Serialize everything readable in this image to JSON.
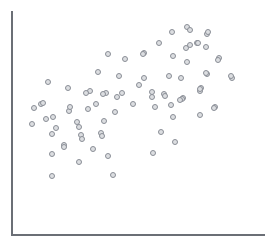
{
  "chart_data": {
    "type": "scatter",
    "title": "",
    "subtitle": "",
    "xlabel": "",
    "ylabel": "",
    "xticklabels": [],
    "yticklabels": [],
    "grid": false,
    "legend": null,
    "legend_position": "none",
    "axes": {
      "spines_visible": [
        "left",
        "bottom"
      ],
      "spine_color": "#6b6f76",
      "xlim": [
        0,
        278
      ],
      "ylim": [
        0,
        244
      ],
      "note": "Axes are unlabeled; values below are given in pixel coordinates of the figure, origin top-left."
    },
    "marker": {
      "shape": "circle-open",
      "size_px": 6,
      "edge_color": "#8a8e96",
      "face_color": "#dcdee1",
      "edge_width_px": 1
    },
    "n_points": 84,
    "background_color": "#ffffff",
    "points": [
      {
        "x": 172,
        "y": 32
      },
      {
        "x": 187,
        "y": 27
      },
      {
        "x": 207,
        "y": 34
      },
      {
        "x": 159,
        "y": 43
      },
      {
        "x": 186,
        "y": 48
      },
      {
        "x": 197,
        "y": 43
      },
      {
        "x": 206,
        "y": 47
      },
      {
        "x": 144,
        "y": 53
      },
      {
        "x": 190,
        "y": 30
      },
      {
        "x": 208,
        "y": 32
      },
      {
        "x": 198,
        "y": 43
      },
      {
        "x": 219,
        "y": 58
      },
      {
        "x": 108,
        "y": 54
      },
      {
        "x": 125,
        "y": 59
      },
      {
        "x": 143,
        "y": 54
      },
      {
        "x": 173,
        "y": 56
      },
      {
        "x": 187,
        "y": 62
      },
      {
        "x": 218,
        "y": 60
      },
      {
        "x": 98,
        "y": 72
      },
      {
        "x": 119,
        "y": 76
      },
      {
        "x": 144,
        "y": 78
      },
      {
        "x": 169,
        "y": 76
      },
      {
        "x": 181,
        "y": 78
      },
      {
        "x": 207,
        "y": 74
      },
      {
        "x": 206,
        "y": 73
      },
      {
        "x": 232,
        "y": 78
      },
      {
        "x": 90,
        "y": 91
      },
      {
        "x": 106,
        "y": 93
      },
      {
        "x": 122,
        "y": 93
      },
      {
        "x": 152,
        "y": 92
      },
      {
        "x": 164,
        "y": 94
      },
      {
        "x": 183,
        "y": 98
      },
      {
        "x": 201,
        "y": 88
      },
      {
        "x": 48,
        "y": 82
      },
      {
        "x": 68,
        "y": 88
      },
      {
        "x": 86,
        "y": 93
      },
      {
        "x": 103,
        "y": 94
      },
      {
        "x": 117,
        "y": 97
      },
      {
        "x": 41,
        "y": 104
      },
      {
        "x": 53,
        "y": 117
      },
      {
        "x": 69,
        "y": 111
      },
      {
        "x": 88,
        "y": 109
      },
      {
        "x": 115,
        "y": 112
      },
      {
        "x": 152,
        "y": 97
      },
      {
        "x": 165,
        "y": 96
      },
      {
        "x": 182,
        "y": 99
      },
      {
        "x": 200,
        "y": 91
      },
      {
        "x": 155,
        "y": 107
      },
      {
        "x": 171,
        "y": 105
      },
      {
        "x": 32,
        "y": 124
      },
      {
        "x": 77,
        "y": 122
      },
      {
        "x": 104,
        "y": 121
      },
      {
        "x": 180,
        "y": 100
      },
      {
        "x": 215,
        "y": 107
      },
      {
        "x": 200,
        "y": 115
      },
      {
        "x": 173,
        "y": 117
      },
      {
        "x": 200,
        "y": 89
      },
      {
        "x": 214,
        "y": 108
      },
      {
        "x": 81,
        "y": 135
      },
      {
        "x": 101,
        "y": 133
      },
      {
        "x": 52,
        "y": 134
      },
      {
        "x": 64,
        "y": 145
      },
      {
        "x": 79,
        "y": 127
      },
      {
        "x": 82,
        "y": 139
      },
      {
        "x": 102,
        "y": 136
      },
      {
        "x": 161,
        "y": 132
      },
      {
        "x": 52,
        "y": 154
      },
      {
        "x": 64,
        "y": 147
      },
      {
        "x": 93,
        "y": 149
      },
      {
        "x": 108,
        "y": 156
      },
      {
        "x": 79,
        "y": 162
      },
      {
        "x": 113,
        "y": 175
      },
      {
        "x": 175,
        "y": 142
      },
      {
        "x": 153,
        "y": 153
      },
      {
        "x": 52,
        "y": 176
      },
      {
        "x": 34,
        "y": 108
      },
      {
        "x": 46,
        "y": 119
      },
      {
        "x": 56,
        "y": 128
      },
      {
        "x": 70,
        "y": 107
      },
      {
        "x": 43,
        "y": 103
      },
      {
        "x": 96,
        "y": 104
      },
      {
        "x": 133,
        "y": 104
      },
      {
        "x": 139,
        "y": 85
      },
      {
        "x": 231,
        "y": 76
      },
      {
        "x": 190,
        "y": 45
      }
    ]
  }
}
